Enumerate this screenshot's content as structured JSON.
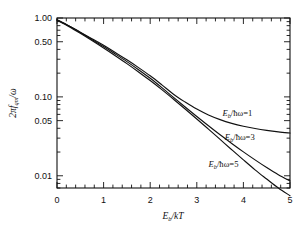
{
  "chart_data": {
    "type": "line",
    "title": "",
    "xlabel": "E_b/kT",
    "ylabel": "2πf_qm/ω",
    "xscale": "linear",
    "yscale": "log",
    "xlim": [
      0,
      5
    ],
    "ylim": [
      0.007,
      1.0
    ],
    "grid": false,
    "legend_position": "inline-right",
    "xticks": [
      0,
      1,
      2,
      3,
      4,
      5
    ],
    "xticklabels": [
      "0",
      "1",
      "2",
      "3",
      "4",
      "5"
    ],
    "xminor_step": 0.2,
    "yticklabels": [
      "1.00",
      "0.50",
      "0.10",
      "0.05",
      "0.01"
    ],
    "ytickvalues": [
      1.0,
      0.5,
      0.1,
      0.05,
      0.01
    ],
    "series": [
      {
        "name": "E_b/ħω = 1",
        "label": "E_b/ħω=1",
        "color": "#111111",
        "x": [
          0.0,
          0.25,
          0.5,
          0.75,
          1.0,
          1.25,
          1.5,
          1.75,
          2.0,
          2.25,
          2.5,
          2.75,
          3.0,
          3.25,
          3.5,
          3.75,
          4.0,
          4.25,
          4.5,
          4.75,
          5.0
        ],
        "y": [
          0.95,
          0.8,
          0.66,
          0.545,
          0.45,
          0.365,
          0.295,
          0.235,
          0.185,
          0.142,
          0.108,
          0.086,
          0.07,
          0.059,
          0.0515,
          0.0462,
          0.0424,
          0.0397,
          0.0376,
          0.036,
          0.0348
        ]
      },
      {
        "name": "E_b/ħω = 3",
        "label": "E_b/ħω=3",
        "color": "#111111",
        "x": [
          0.0,
          0.25,
          0.5,
          0.75,
          1.0,
          1.25,
          1.5,
          1.75,
          2.0,
          2.25,
          2.5,
          2.75,
          3.0,
          3.25,
          3.5,
          3.75,
          4.0,
          4.25,
          4.5,
          4.75,
          5.0
        ],
        "y": [
          0.95,
          0.795,
          0.655,
          0.535,
          0.435,
          0.35,
          0.28,
          0.221,
          0.172,
          0.131,
          0.0985,
          0.0745,
          0.0565,
          0.0431,
          0.0331,
          0.0257,
          0.0201,
          0.0159,
          0.0127,
          0.0103,
          0.0086
        ]
      },
      {
        "name": "E_b/ħω = 5",
        "label": "E_b/ħω=5",
        "color": "#111111",
        "x": [
          0.0,
          0.25,
          0.5,
          0.75,
          1.0,
          1.25,
          1.5,
          1.75,
          2.0,
          2.25,
          2.5,
          2.75,
          3.0,
          3.25,
          3.5,
          3.75,
          4.0,
          4.25,
          4.5,
          4.75,
          5.0
        ],
        "y": [
          0.94,
          0.783,
          0.64,
          0.518,
          0.417,
          0.333,
          0.264,
          0.207,
          0.161,
          0.1235,
          0.0935,
          0.0703,
          0.0525,
          0.039,
          0.0289,
          0.0214,
          0.0159,
          0.0119,
          0.0091,
          0.007,
          0.0056
        ]
      }
    ],
    "annotations": [
      {
        "text": "E_b/ħω=1",
        "x": 3.55,
        "y": 0.058
      },
      {
        "text": "E_b/ħω=3",
        "x": 3.6,
        "y": 0.0285
      },
      {
        "text": "E_b/ħω=5",
        "x": 3.25,
        "y": 0.0128
      }
    ]
  },
  "axis": {
    "y_title_parts": {
      "lead": "2πf",
      "sub": "qm",
      "tail": "/ω"
    },
    "x_title_parts": {
      "e": "E",
      "sub": "b",
      "tail": "/kT"
    }
  },
  "labels": {
    "curve1": {
      "e": "E",
      "sub": "b",
      "mid": "/ħω",
      "eq": "=1"
    },
    "curve2": {
      "e": "E",
      "sub": "b",
      "mid": "/ħω",
      "eq": "=3"
    },
    "curve3": {
      "e": "E",
      "sub": "b",
      "mid": "/ħω",
      "eq": "=5"
    }
  },
  "yticks_text": {
    "t1": "1.00",
    "t2": "0.50",
    "t3": "0.10",
    "t4": "0.05",
    "t5": "0.01"
  },
  "xticks_text": {
    "t0": "0",
    "t1": "1",
    "t2": "2",
    "t3": "3",
    "t4": "4",
    "t5": "5"
  }
}
